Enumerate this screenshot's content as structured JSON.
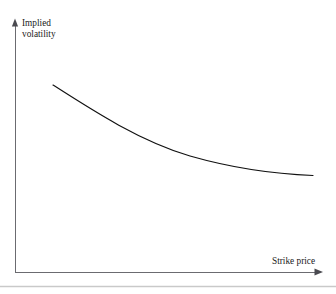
{
  "figure": {
    "caption_partial": "",
    "background_color": "#ffffff"
  },
  "chart_data": {
    "type": "line",
    "title": "",
    "xlabel": "Strike price",
    "ylabel": "Implied volatility",
    "legend": [],
    "grid": false,
    "axis_style": "arrow-tipped L-shaped axes, no tick marks, no tick labels",
    "axis_color": "#6b6b70",
    "line_color": "#111111",
    "line_width": 1,
    "xlim": [
      0,
      336
    ],
    "ylim": [
      0,
      294
    ],
    "annotations": [],
    "x": [
      53,
      70,
      90,
      110,
      130,
      150,
      170,
      190,
      210,
      230,
      250,
      270,
      290,
      313
    ],
    "y": [
      85,
      95,
      106,
      118,
      128,
      138,
      146,
      153,
      159,
      164,
      168,
      171,
      174,
      175
    ],
    "curve_path": "M 53 85 C 95 112, 140 141, 190 156 C 232 168, 275 174, 313 175.5"
  },
  "axes": {
    "y_axis": {
      "x": 15,
      "top": 20,
      "bottom": 272,
      "arrow": "up"
    },
    "x_axis": {
      "y": 272,
      "left": 15,
      "right": 322,
      "arrow": "right"
    }
  },
  "footer_rule": {
    "color": "#c8c8c8",
    "y": 286
  },
  "labels": {
    "y_axis_line1": "Implied",
    "y_axis_line2": "volatility",
    "x_axis": "Strike price"
  }
}
